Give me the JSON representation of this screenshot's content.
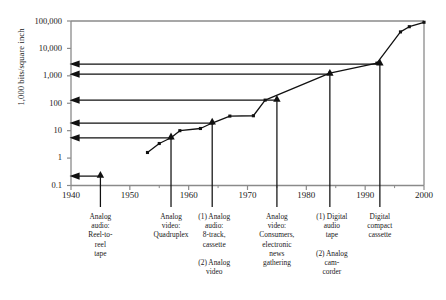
{
  "chart_data": {
    "type": "line",
    "title": "",
    "subtitle": "",
    "xlabel": "",
    "ylabel": "1,000 bits/square inch",
    "yscale": "log",
    "ylim": [
      0.1,
      100000
    ],
    "xlim": [
      1940,
      2000
    ],
    "grid": false,
    "legend": "none",
    "y_ticklabels": [
      "100,000",
      "10,000",
      "1,000",
      "100",
      "10",
      "1",
      "0.1"
    ],
    "y_tickvalues": [
      100000,
      10000,
      1000,
      100,
      10,
      1,
      0.1
    ],
    "x_ticklabels": [
      "1940",
      "1950",
      "1960",
      "1970",
      "1980",
      "1990",
      "2000"
    ],
    "x_tickvalues": [
      1940,
      1950,
      1960,
      1970,
      1980,
      1990,
      2000
    ],
    "x_minor_tickvalues": [
      1945,
      1955,
      1965,
      1975,
      1985,
      1995
    ],
    "series": [
      {
        "name": "Areal density",
        "marker": "square",
        "points": [
          {
            "x": 1953,
            "y": 1.6
          },
          {
            "x": 1955,
            "y": 3.4
          },
          {
            "x": 1957,
            "y": 5.5
          },
          {
            "x": 1958.5,
            "y": 10
          },
          {
            "x": 1962,
            "y": 12
          },
          {
            "x": 1964,
            "y": 19
          },
          {
            "x": 1967,
            "y": 34
          },
          {
            "x": 1971,
            "y": 35
          },
          {
            "x": 1973,
            "y": 130
          },
          {
            "x": 1984,
            "y": 1250
          },
          {
            "x": 1992,
            "y": 2900
          },
          {
            "x": 1996,
            "y": 40000
          },
          {
            "x": 1997.5,
            "y": 62000
          },
          {
            "x": 2000,
            "y": 90000
          }
        ]
      }
    ],
    "annotations": [
      {
        "id": "a1",
        "x": 1945,
        "y": 0.22,
        "marker": "triangle",
        "arrow_to_axis": true
      },
      {
        "id": "a2",
        "x": 1957,
        "y": 5.5,
        "marker": "triangle",
        "arrow_to_axis": true
      },
      {
        "id": "a3",
        "x": 1964,
        "y": 19,
        "marker": "triangle",
        "arrow_to_axis": true
      },
      {
        "id": "a4",
        "x": 1975,
        "y": 130,
        "marker": "triangle",
        "arrow_to_axis": true
      },
      {
        "id": "a5",
        "x": 1984,
        "y": 1150,
        "marker": "triangle",
        "arrow_to_axis": true
      },
      {
        "id": "a6",
        "x": 1992.5,
        "y": 2700,
        "marker": "triangle",
        "arrow_to_axis": true
      }
    ]
  },
  "axis": {
    "y_label": "1,000 bits/square inch",
    "y_ticks": [
      {
        "label": "100,000"
      },
      {
        "label": "10,000"
      },
      {
        "label": "1,000"
      },
      {
        "label": "100"
      },
      {
        "label": "10"
      },
      {
        "label": "1"
      },
      {
        "label": "0.1"
      }
    ],
    "x_ticks": [
      {
        "label": "1940"
      },
      {
        "label": "1950"
      },
      {
        "label": "1960"
      },
      {
        "label": "1970"
      },
      {
        "label": "1980"
      },
      {
        "label": "1990"
      },
      {
        "label": "2000"
      }
    ]
  },
  "callouts": [
    {
      "id": "callout-1",
      "year": 1945,
      "text": "Analog\naudio:\nReel-to-\nreel\ntape"
    },
    {
      "id": "callout-2",
      "year": 1957,
      "text": "Analog\nvideo:\nQuadruplex"
    },
    {
      "id": "callout-3",
      "year": 1964,
      "text": "(1) Analog\naudio:\n8-track,\ncassette\n\n(2) Analog\nvideo"
    },
    {
      "id": "callout-4",
      "year": 1975,
      "text": "Analog\nvideo:\nConsumers,\nelectronic\nnews\ngathering"
    },
    {
      "id": "callout-5",
      "year": 1984,
      "text": "(1) Digital\naudio\ntape\n\n(2) Analog\ncam-\ncorder"
    },
    {
      "id": "callout-6",
      "year": 1992.5,
      "text": "Digital\ncompact\ncassette"
    }
  ],
  "colors": {
    "axis": "#8a8a8a",
    "line": "#111111",
    "marker": "#111111",
    "text": "#1a1a1a"
  }
}
